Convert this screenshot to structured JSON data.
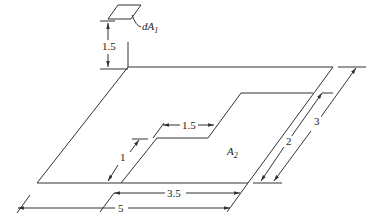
{
  "diagram": {
    "type": "view-factor geometry",
    "elements": {
      "dA1_label": "dA",
      "dA1_sub": "1",
      "A2_label": "A",
      "A2_sub": "2"
    },
    "dimensions": {
      "height": "1.5",
      "inner_step_width": "1.5",
      "inner_offset": "1",
      "inner_length": "3.5",
      "outer_length": "5",
      "inner_depth": "2",
      "outer_depth": "3"
    },
    "colors": {
      "line": "#333333",
      "background": "#ffffff"
    }
  }
}
